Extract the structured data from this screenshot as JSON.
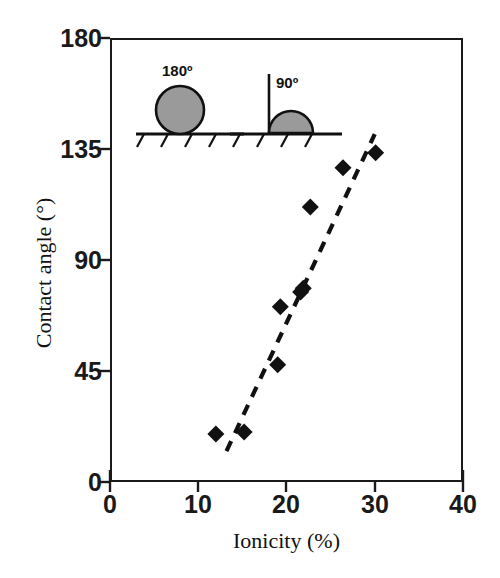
{
  "chart_data": {
    "type": "scatter",
    "title": "",
    "xlabel": "Ionicity (%)",
    "ylabel": "Contact angle (°)",
    "xlim": [
      0,
      40
    ],
    "ylim": [
      0,
      180
    ],
    "xticks": [
      0,
      10,
      20,
      30,
      40
    ],
    "yticks": [
      0,
      45,
      90,
      135,
      180
    ],
    "grid": false,
    "legend": null,
    "marker": "filled-diamond",
    "marker_color": "#111111",
    "points": [
      {
        "x": 12.0,
        "y": 19.5
      },
      {
        "x": 15.2,
        "y": 20.3
      },
      {
        "x": 19.0,
        "y": 47.5
      },
      {
        "x": 19.3,
        "y": 71.0
      },
      {
        "x": 21.6,
        "y": 77.0
      },
      {
        "x": 21.9,
        "y": 78.5
      },
      {
        "x": 22.7,
        "y": 111.5
      },
      {
        "x": 26.4,
        "y": 127.4
      },
      {
        "x": 30.1,
        "y": 133.5
      }
    ],
    "trendline": {
      "style": "dashed",
      "color": "#111111",
      "x_start": 13.2,
      "y_start": 12.5,
      "x_end": 30.0,
      "y_end": 141.0
    }
  },
  "axes": {
    "x_tick_labels": [
      "0",
      "10",
      "20",
      "30",
      "40"
    ],
    "y_tick_labels": [
      "180",
      "135",
      "90",
      "45",
      "0"
    ],
    "x_title": "Ionicity (%)",
    "y_title": "Contact angle (°)"
  },
  "insets": [
    {
      "id": "inset-180",
      "label": "180º",
      "shape": "full-sphere-droplet",
      "description": "non-wetting spherical droplet resting on a hatched solid surface",
      "fill_color": "#9a9a9a"
    },
    {
      "id": "inset-90",
      "label": "90º",
      "shape": "hemisphere-droplet",
      "description": "hemispherical droplet on a hatched solid surface with vertical reference line",
      "fill_color": "#9a9a9a"
    }
  ],
  "caption_remnant": ""
}
